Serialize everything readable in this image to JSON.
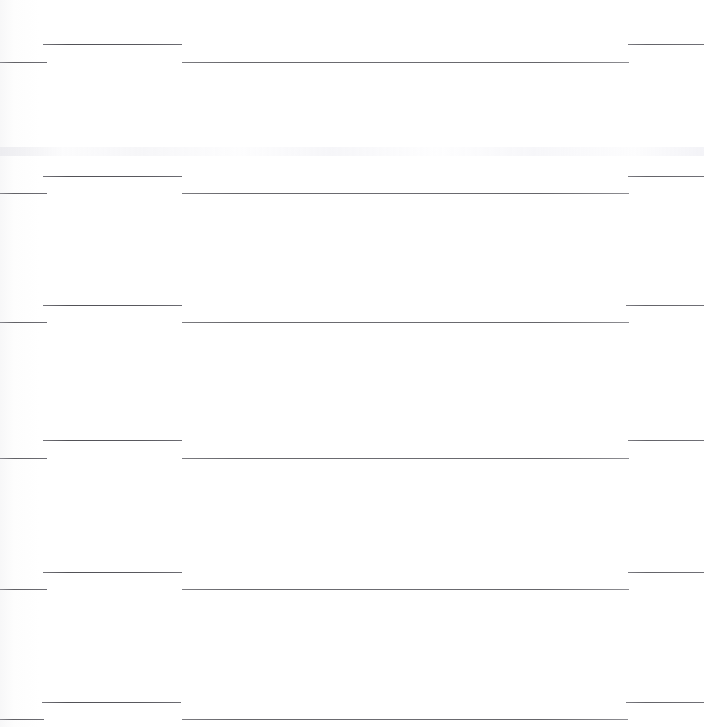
{
  "document": {
    "kind": "scanned-ruled-page",
    "page_width": 704,
    "page_height": 727,
    "background_color": "#ffffff",
    "rule_color": "#3a3a3e",
    "visible_text": "",
    "note": "No legible text is rendered in this scan; only horizontal rule segments remain."
  },
  "chart_data": {
    "type": "line",
    "title": "",
    "xlabel": "",
    "ylabel": "",
    "xlim": [
      0,
      704
    ],
    "ylim": [
      0,
      727
    ],
    "grid": false,
    "legend_position": "none",
    "categories": [],
    "series": [
      {
        "name": "row-group-1",
        "segments": [
          {
            "name": "left-stub",
            "x1": 0,
            "x2": 47,
            "y": 62
          },
          {
            "name": "upper-rule",
            "x1": 43,
            "x2": 182,
            "y": 44
          },
          {
            "name": "long-rule",
            "x1": 182,
            "x2": 629,
            "y": 62
          },
          {
            "name": "right-stub",
            "x1": 628,
            "x2": 704,
            "y": 44
          }
        ]
      },
      {
        "name": "row-group-2",
        "segments": [
          {
            "name": "left-stub",
            "x1": 0,
            "x2": 47,
            "y": 193
          },
          {
            "name": "upper-rule",
            "x1": 43,
            "x2": 182,
            "y": 176
          },
          {
            "name": "long-rule",
            "x1": 182,
            "x2": 629,
            "y": 193
          },
          {
            "name": "right-stub",
            "x1": 628,
            "x2": 704,
            "y": 176
          }
        ]
      },
      {
        "name": "row-group-3",
        "segments": [
          {
            "name": "left-stub",
            "x1": 0,
            "x2": 47,
            "y": 322
          },
          {
            "name": "upper-rule",
            "x1": 43,
            "x2": 182,
            "y": 305
          },
          {
            "name": "long-rule",
            "x1": 182,
            "x2": 629,
            "y": 322
          },
          {
            "name": "right-stub",
            "x1": 626,
            "x2": 704,
            "y": 305
          }
        ]
      },
      {
        "name": "row-group-4",
        "segments": [
          {
            "name": "left-stub",
            "x1": 0,
            "x2": 47,
            "y": 458
          },
          {
            "name": "upper-rule",
            "x1": 43,
            "x2": 182,
            "y": 440
          },
          {
            "name": "long-rule",
            "x1": 182,
            "x2": 629,
            "y": 458
          },
          {
            "name": "right-stub",
            "x1": 628,
            "x2": 704,
            "y": 440
          }
        ]
      },
      {
        "name": "row-group-5",
        "segments": [
          {
            "name": "left-stub",
            "x1": 0,
            "x2": 47,
            "y": 589
          },
          {
            "name": "upper-rule",
            "x1": 43,
            "x2": 182,
            "y": 572
          },
          {
            "name": "long-rule",
            "x1": 182,
            "x2": 629,
            "y": 589
          },
          {
            "name": "right-stub",
            "x1": 628,
            "x2": 704,
            "y": 572
          }
        ]
      },
      {
        "name": "row-group-6",
        "segments": [
          {
            "name": "left-stub",
            "x1": 0,
            "x2": 44,
            "y": 719
          },
          {
            "name": "upper-rule",
            "x1": 42,
            "x2": 181,
            "y": 702
          },
          {
            "name": "long-rule",
            "x1": 182,
            "x2": 628,
            "y": 719
          },
          {
            "name": "right-stub",
            "x1": 626,
            "x2": 704,
            "y": 702
          }
        ]
      }
    ],
    "annotations": [
      {
        "name": "ghost-band",
        "y": 152,
        "height": 9,
        "description": "faint residual toner band"
      }
    ]
  }
}
